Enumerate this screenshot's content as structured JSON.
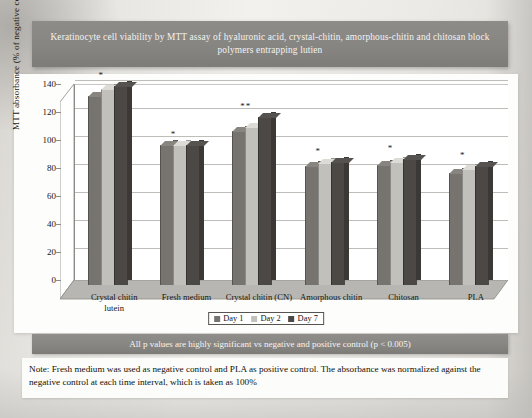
{
  "figure": {
    "title": "Keratinocyte cell viability by MTT assay of hyaluronic acid, crystal-chitin, amorphous-chitin and chitosan block polymers entrapping lutien",
    "p_banner": "All p values are highly significant vs negative and positive control (p < 0.005)",
    "note": "Note: Fresh medium was used as negative control and PLA as positive control. The absorbance was normalized against the negative control at each time interval, which is taken as 100%"
  },
  "significance_legend": {
    "rows": [
      {
        "symbol": "*",
        "text": "= not significant"
      },
      {
        "symbol": "**",
        "text": "= p>0.05"
      }
    ]
  },
  "colors": {
    "day1": "#77746f",
    "day2": "#c2c0bb",
    "day7": "#4b4845",
    "banner": "#878582",
    "axis": "#8c8a87",
    "grid": "#bfbdba"
  },
  "chart_data": {
    "type": "bar",
    "title": "Keratinocyte cell viability by MTT assay of hyaluronic acid, crystal-chitin, amorphous-chitin and chitosan block polymers entrapping lutien",
    "xlabel": "",
    "ylabel": "MTT absorbance (% of negative control)",
    "ylim": [
      0,
      140
    ],
    "yticks": [
      0,
      20,
      40,
      60,
      80,
      100,
      120,
      140
    ],
    "grid": true,
    "legend_position": "bottom-center",
    "categories": [
      "Crystal chitin lutein",
      "Fresh medium",
      "Crystal chitin (CN)",
      "Amorphous chitin",
      "Chitosan",
      "PLA"
    ],
    "category_lines": [
      [
        "Crystal chitin",
        "lutein"
      ],
      [
        "Fresh medium"
      ],
      [
        "Crystal chitin (CN)"
      ],
      [
        "Amorphous chitin"
      ],
      [
        "Chitosan"
      ],
      [
        "PLA"
      ]
    ],
    "series": [
      {
        "name": "Day 1",
        "color": "#77746f",
        "values": [
          135,
          100,
          110,
          85,
          86,
          80
        ]
      },
      {
        "name": "Day 2",
        "color": "#c2c0bb",
        "values": [
          140,
          100,
          113,
          87,
          88,
          83
        ]
      },
      {
        "name": "Day 7",
        "color": "#4b4845",
        "values": [
          142,
          100,
          120,
          88,
          90,
          85
        ]
      }
    ],
    "annotations": [
      {
        "category": "Crystal chitin lutein",
        "marker": "*"
      },
      {
        "category": "Fresh medium",
        "marker": "*"
      },
      {
        "category": "Crystal chitin (CN)",
        "marker": "**"
      },
      {
        "category": "Amorphous chitin",
        "marker": "*"
      },
      {
        "category": "Chitosan",
        "marker": "*"
      },
      {
        "category": "PLA",
        "marker": "*"
      }
    ]
  }
}
